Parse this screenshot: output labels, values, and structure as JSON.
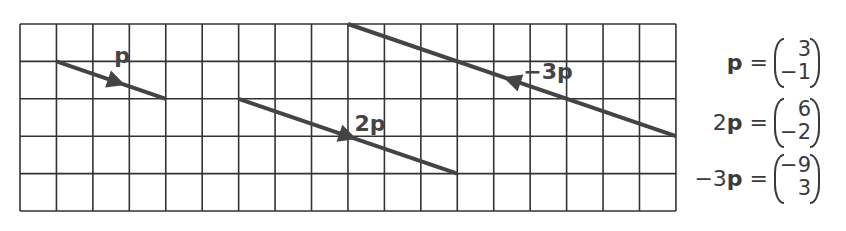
{
  "grid": {
    "columns": 18,
    "rows": 5,
    "left": 20,
    "top": 24,
    "cell_width": 36.44,
    "cell_height": 37.4,
    "line_color": "#333333"
  },
  "vectors": [
    {
      "id": "p",
      "label": "p",
      "start": [
        1,
        1
      ],
      "end": [
        4,
        2
      ],
      "arrow_at": [
        0.55
      ],
      "label_pos": [
        122,
        57
      ]
    },
    {
      "id": "2p",
      "label": "2p",
      "start": [
        6,
        2
      ],
      "end": [
        12,
        4
      ],
      "arrow_at": [
        0.5
      ],
      "label_pos": [
        370,
        125
      ]
    },
    {
      "id": "neg3p",
      "label": "−3p",
      "start": [
        18,
        3
      ],
      "end": [
        9,
        0
      ],
      "arrow_at": [
        0.5
      ],
      "label_pos": [
        548,
        73
      ]
    }
  ],
  "vector_color": "#444444",
  "equations": [
    {
      "coef": "",
      "symbol": "p",
      "equals": "=",
      "top": "3",
      "bottom": "−1"
    },
    {
      "coef": "2",
      "symbol": "p",
      "equals": "=",
      "top": "6",
      "bottom": "−2"
    },
    {
      "coef": "−3",
      "symbol": "p",
      "equals": "=",
      "top": "−9",
      "bottom": "3"
    }
  ]
}
